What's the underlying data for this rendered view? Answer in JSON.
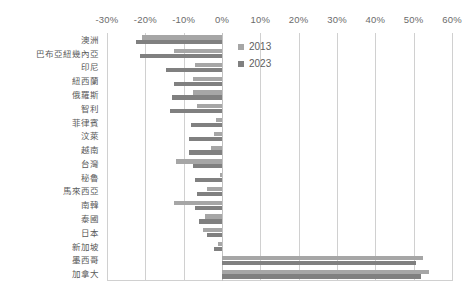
{
  "chart_data": {
    "type": "bar",
    "orientation": "horizontal",
    "title": "",
    "subtitle": "",
    "xlabel": "",
    "ylabel": "",
    "xlim": [
      -30,
      60
    ],
    "xticks": [
      -30,
      -20,
      -10,
      0,
      10,
      20,
      30,
      40,
      50,
      60
    ],
    "xtick_labels": [
      "-30%",
      "-20%",
      "-10%",
      "0%",
      "10%",
      "20%",
      "30%",
      "40%",
      "50%",
      "60%"
    ],
    "grid": true,
    "legend_position": "inside-top-right",
    "categories": [
      "澳洲",
      "巴布亞紐幾內亞",
      "印尼",
      "紐西蘭",
      "俄羅斯",
      "智利",
      "菲律賓",
      "汶萊",
      "越南",
      "台灣",
      "秘魯",
      "馬來西亞",
      "南韓",
      "泰國",
      "日本",
      "新加坡",
      "墨西哥",
      "加拿大"
    ],
    "series": [
      {
        "name": "2013",
        "color": "#a6a6a6",
        "values": [
          -21.0,
          -12.5,
          -7.0,
          -7.5,
          -7.5,
          -6.5,
          -1.5,
          -2.0,
          -3.0,
          -12.0,
          -0.5,
          -4.0,
          -12.5,
          -4.5,
          -5.0,
          -1.0,
          52.5,
          54.0
        ]
      },
      {
        "name": "2023",
        "color": "#808080",
        "values": [
          -22.5,
          -21.5,
          -14.5,
          -12.5,
          -13.0,
          -13.5,
          -8.0,
          -8.5,
          -8.5,
          -7.5,
          -7.0,
          -6.5,
          -7.0,
          -6.0,
          -4.0,
          -2.0,
          50.5,
          52.0
        ]
      }
    ],
    "legend": [
      {
        "label": "2013",
        "color": "#a6a6a6"
      },
      {
        "label": "2023",
        "color": "#808080"
      }
    ]
  },
  "colors": {
    "series_2013": "#a6a6a6",
    "series_2023": "#808080",
    "gridline": "#d0d0d0",
    "text": "#5a5a5a",
    "background": "#ffffff"
  }
}
